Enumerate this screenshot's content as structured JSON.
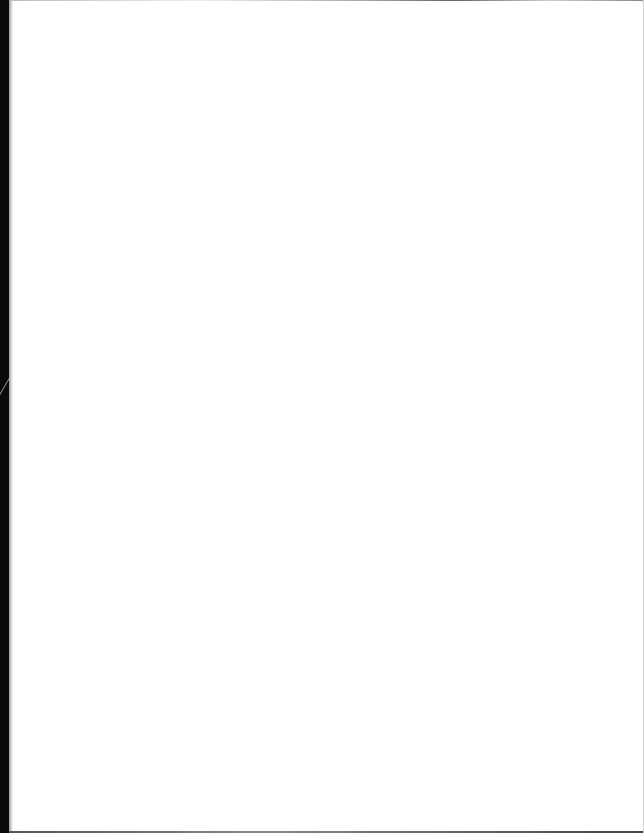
{
  "document": {
    "type": "scanned-page",
    "content": "",
    "is_blank": true,
    "colors": {
      "paper": "#ffffff",
      "spine": "#0a0a0a"
    }
  }
}
